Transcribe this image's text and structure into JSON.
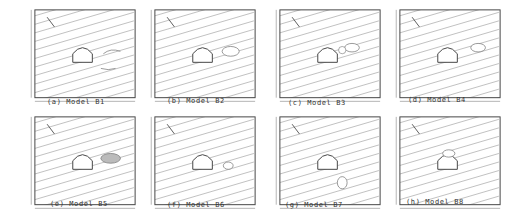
{
  "figure": {
    "panels": [
      {
        "id": "a",
        "caption": "(a) Model B1",
        "labels": [
          "cavity",
          "seam"
        ],
        "feature": "seam-and-cavity"
      },
      {
        "id": "b",
        "caption": "(b) Model B2",
        "labels": [],
        "feature": "cavity-upper-right"
      },
      {
        "id": "c",
        "caption": "(c) Model B3",
        "labels": [
          "B"
        ],
        "feature": "cavity-above"
      },
      {
        "id": "d",
        "caption": "(d) Model B4",
        "labels": [
          "B"
        ],
        "feature": "cavity-above-right"
      },
      {
        "id": "e",
        "caption": "(e) Model B5",
        "labels": [
          "filling"
        ],
        "feature": "filled-cavity"
      },
      {
        "id": "f",
        "caption": "(f) Model B6",
        "labels": [],
        "feature": "small-cavity-right"
      },
      {
        "id": "g",
        "caption": "(g) Model B7",
        "labels": [
          "B"
        ],
        "feature": "cavity-below"
      },
      {
        "id": "h",
        "caption": "(h) Model B8",
        "labels": [],
        "feature": "cavity-upper-left"
      }
    ],
    "common": {
      "dimension_label": "400",
      "angle_label": "75°",
      "tunnel_label": "B1"
    }
  }
}
